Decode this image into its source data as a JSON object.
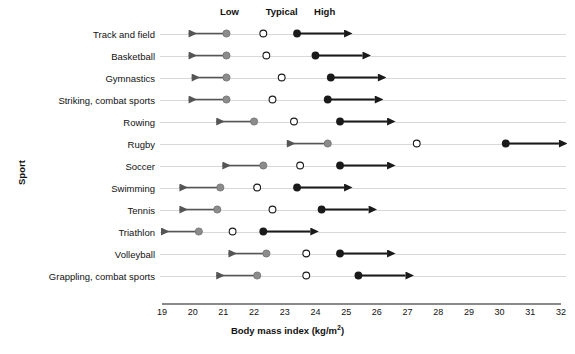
{
  "chart_data": {
    "type": "scatter",
    "title": "",
    "xlabel": "Body mass index (kg/m2)",
    "xlabel_html": "Body mass index (kg/m²)",
    "ylabel": "Sport",
    "xlim": [
      19,
      32
    ],
    "xticks": [
      19,
      20,
      21,
      22,
      23,
      24,
      25,
      26,
      27,
      28,
      29,
      30,
      31,
      32
    ],
    "grid": false,
    "legend_position": "top",
    "column_headers": [
      {
        "label": "Low",
        "x": 21.2
      },
      {
        "label": "Typical",
        "x": 22.9
      },
      {
        "label": "High",
        "x": 24.3
      }
    ],
    "series": [
      {
        "name": "Low",
        "marker": "filled-circle-gray",
        "color": "#8c8c8c",
        "arrow": "left"
      },
      {
        "name": "Typical",
        "marker": "open-circle",
        "color": "#ffffff",
        "arrow": "none"
      },
      {
        "name": "High",
        "marker": "filled-circle-black",
        "color": "#1a1a1a",
        "arrow": "right"
      }
    ],
    "categories": [
      "Track and field",
      "Basketball",
      "Gymnastics",
      "Striking, combat sports",
      "Rowing",
      "Rugby",
      "Soccer",
      "Swimming",
      "Tennis",
      "Triathlon",
      "Volleyball",
      "Grappling, combat sports"
    ],
    "rows": [
      {
        "sport": "Track and field",
        "low": 21.1,
        "typical": 22.3,
        "high": 23.4,
        "low_arrow_end": 19.9,
        "high_arrow_end": 24.9
      },
      {
        "sport": "Basketball",
        "low": 21.1,
        "typical": 22.4,
        "high": 24.0,
        "low_arrow_end": 19.9,
        "high_arrow_end": 25.5
      },
      {
        "sport": "Gymnastics",
        "low": 21.1,
        "typical": 22.9,
        "high": 24.5,
        "low_arrow_end": 20.0,
        "high_arrow_end": 26.0
      },
      {
        "sport": "Striking, combat sports",
        "low": 21.1,
        "typical": 22.6,
        "high": 24.4,
        "low_arrow_end": 19.9,
        "high_arrow_end": 25.9
      },
      {
        "sport": "Rowing",
        "low": 22.0,
        "typical": 23.3,
        "high": 24.8,
        "low_arrow_end": 20.8,
        "high_arrow_end": 26.3
      },
      {
        "sport": "Rugby",
        "low": 24.4,
        "typical": 27.3,
        "high": 30.2,
        "low_arrow_end": 23.1,
        "high_arrow_end": 31.9
      },
      {
        "sport": "Soccer",
        "low": 22.3,
        "typical": 23.5,
        "high": 24.8,
        "low_arrow_end": 21.0,
        "high_arrow_end": 26.3
      },
      {
        "sport": "Swimming",
        "low": 20.9,
        "typical": 22.1,
        "high": 23.4,
        "low_arrow_end": 19.6,
        "high_arrow_end": 24.9
      },
      {
        "sport": "Tennis",
        "low": 20.8,
        "typical": 22.6,
        "high": 24.2,
        "low_arrow_end": 19.6,
        "high_arrow_end": 25.7
      },
      {
        "sport": "Triathlon",
        "low": 20.2,
        "typical": 21.3,
        "high": 22.3,
        "low_arrow_end": 19.0,
        "high_arrow_end": 23.8
      },
      {
        "sport": "Volleyball",
        "low": 22.4,
        "typical": 23.7,
        "high": 24.8,
        "low_arrow_end": 21.2,
        "high_arrow_end": 26.3
      },
      {
        "sport": "Grappling, combat sports",
        "low": 22.1,
        "typical": 23.7,
        "high": 25.4,
        "low_arrow_end": 20.8,
        "high_arrow_end": 26.9
      }
    ]
  },
  "axes": {
    "x_title": "Body mass index (kg/m",
    "x_title_sup": "2",
    "x_title_tail": ")",
    "y_title": "Sport"
  },
  "colors": {
    "low": "#8c8c8c",
    "typical": "#ffffff",
    "typical_stroke": "#1a1a1a",
    "high": "#1a1a1a",
    "row_line": "#d8d8d8",
    "axis": "#8a8a8a",
    "text": "#111111"
  }
}
